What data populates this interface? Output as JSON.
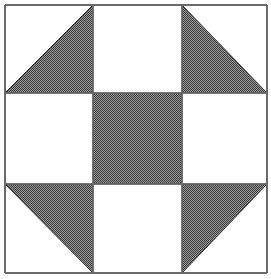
{
  "diagram": {
    "type": "quilt-block",
    "grid": {
      "rows": 3,
      "cols": 3
    },
    "colors": {
      "background": "#ffffff",
      "line": "#6a6a6a",
      "fill_dark": "#3c3c3c",
      "fill_light": "#9a9a9a"
    },
    "bounds": {
      "x0": 5,
      "y0": 5,
      "x1": 267,
      "y1": 273
    },
    "col_lines": [
      5,
      93,
      182,
      267
    ],
    "row_lines": [
      5,
      93,
      184,
      273
    ],
    "cells": [
      {
        "row": 0,
        "col": 0,
        "shape": "triangle",
        "shaded": "bottom-right"
      },
      {
        "row": 0,
        "col": 1,
        "shape": "empty"
      },
      {
        "row": 0,
        "col": 2,
        "shape": "triangle",
        "shaded": "bottom-left"
      },
      {
        "row": 1,
        "col": 0,
        "shape": "empty"
      },
      {
        "row": 1,
        "col": 1,
        "shape": "square"
      },
      {
        "row": 1,
        "col": 2,
        "shape": "empty"
      },
      {
        "row": 2,
        "col": 0,
        "shape": "triangle",
        "shaded": "top-right"
      },
      {
        "row": 2,
        "col": 1,
        "shape": "empty"
      },
      {
        "row": 2,
        "col": 2,
        "shape": "triangle",
        "shaded": "top-left"
      }
    ]
  }
}
